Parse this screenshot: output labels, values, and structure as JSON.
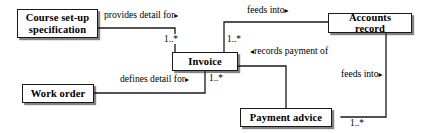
{
  "diagram": {
    "type": "entity-relationship-diagram",
    "title": "",
    "nodes": [
      {
        "id": "course_setup",
        "label": "Course set-up\nspecification"
      },
      {
        "id": "invoice",
        "label": "Invoice"
      },
      {
        "id": "accounts_record",
        "label": "Accounts record"
      },
      {
        "id": "work_order",
        "label": "Work order"
      },
      {
        "id": "payment_advice",
        "label": "Payment advice"
      }
    ],
    "relationships": [
      {
        "id": "rel_provides_detail",
        "from": "course_setup",
        "to": "invoice",
        "label": "provides detail for",
        "direction_marker": "▸",
        "marker_position": "after",
        "multiplicity": "1..*"
      },
      {
        "id": "rel_feeds_into_invoice_accounts",
        "from": "invoice",
        "to": "accounts_record",
        "label": "feeds into",
        "direction_marker": "▸",
        "marker_position": "after",
        "multiplicity": "1..*"
      },
      {
        "id": "rel_records_payment_of",
        "from": "payment_advice",
        "to": "invoice",
        "label": "records payment of",
        "direction_marker": "◂",
        "marker_position": "before",
        "multiplicity": ""
      },
      {
        "id": "rel_defines_detail",
        "from": "work_order",
        "to": "invoice",
        "label": "defines detail for",
        "direction_marker": "▸",
        "marker_position": "after",
        "multiplicity": "1..*"
      },
      {
        "id": "rel_feeds_into_payment_accounts",
        "from": "payment_advice",
        "to": "accounts_record",
        "label": "feeds into",
        "direction_marker": "▸",
        "marker_position": "after",
        "multiplicity": "1..*"
      }
    ],
    "colors": {
      "stroke": "#1a1a1a",
      "fill": "#ffffff",
      "text": "#000000",
      "shadow": "#1e1e1e"
    }
  }
}
